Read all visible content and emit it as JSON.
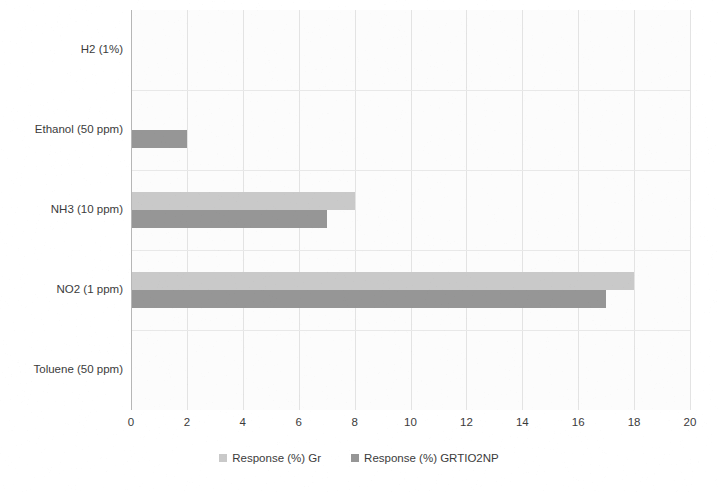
{
  "chart_data": {
    "type": "bar",
    "orientation": "horizontal",
    "title": "",
    "xlabel": "",
    "ylabel": "",
    "xlim": [
      0,
      20
    ],
    "xticks": [
      0,
      2,
      4,
      6,
      8,
      10,
      12,
      14,
      16,
      18,
      20
    ],
    "tick_labels": [
      "0",
      "2",
      "4",
      "6",
      "8",
      "10",
      "12",
      "14",
      "16",
      "18",
      "20"
    ],
    "grid": true,
    "legend_position": "bottom",
    "categories": [
      "H2 (1%)",
      "Ethanol (50 ppm)",
      "NH3 (10 ppm)",
      "NO2 (1 ppm)",
      "Toluene (50 ppm)"
    ],
    "series": [
      {
        "name": "Response (%) Gr",
        "color": "#c9c9c9",
        "values": [
          0,
          0,
          8,
          18,
          0
        ]
      },
      {
        "name": "Response (%) GRTIO2NP",
        "color": "#969696",
        "values": [
          0,
          2,
          7,
          17,
          0
        ]
      }
    ]
  },
  "legend": {
    "items": [
      {
        "label": "Response (%) Gr",
        "color": "#c9c9c9"
      },
      {
        "label": "Response (%) GRTIO2NP",
        "color": "#969696"
      }
    ]
  }
}
